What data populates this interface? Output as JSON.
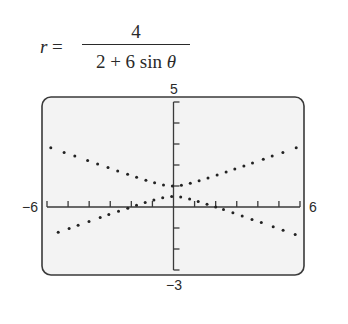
{
  "equation": {
    "lhs": "r =",
    "numerator": "4",
    "denominator": "2 + 6 sin θ"
  },
  "chart_data": {
    "type": "scatter",
    "polar": {
      "a": 4,
      "b": 2,
      "c": 6,
      "function": "sin"
    },
    "xlim": [
      -6,
      6
    ],
    "ylim": [
      -3,
      5
    ],
    "xscale": 1,
    "yscale": 1,
    "grid": false,
    "tick_labels": {
      "xmin": "−6",
      "xmax": "6",
      "ymin": "−3",
      "ymax": "5"
    },
    "vertices": [
      [
        0,
        1
      ],
      [
        0,
        0.5
      ]
    ],
    "edge_points": [
      [
        -6,
        2.886
      ],
      [
        6,
        2.886
      ],
      [
        -6,
        -1.386
      ],
      [
        6,
        -1.386
      ]
    ],
    "xlabel": "",
    "ylabel": ""
  },
  "colors": {
    "frame": "#3a3a3a",
    "screen": "#f3f3f3",
    "dots": "#222222",
    "axes": "#3a3a3a"
  }
}
